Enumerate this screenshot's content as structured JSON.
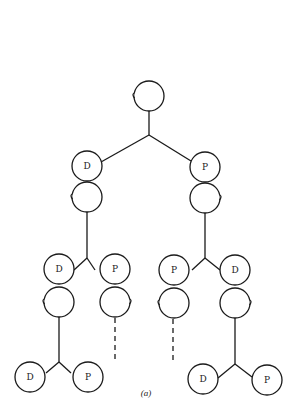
{
  "figure": {
    "caption": "(a)"
  },
  "nodes": {
    "root": {
      "label": ""
    },
    "l1_left": {
      "label": "D"
    },
    "l1_right": {
      "label": "P"
    },
    "l2_a": {
      "label": "D"
    },
    "l2_b": {
      "label": "P"
    },
    "l2_c": {
      "label": "P"
    },
    "l2_d": {
      "label": "D"
    },
    "l3_a": {
      "label": "D"
    },
    "l3_b": {
      "label": "P"
    },
    "l3_c": {
      "label": "D"
    },
    "l3_d": {
      "label": "P"
    }
  },
  "colors": {
    "ink": "#1a1a1a",
    "background": "#ffffff"
  }
}
